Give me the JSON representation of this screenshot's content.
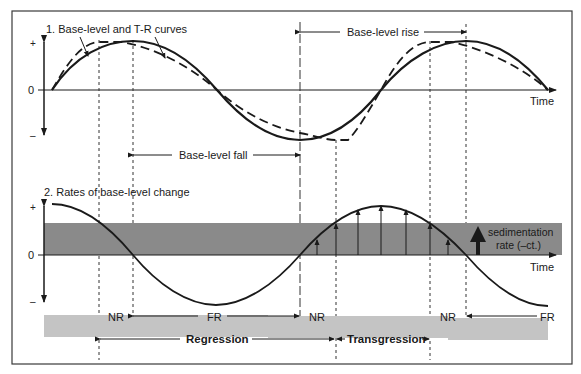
{
  "figure": {
    "panel1": {
      "title": "1. Base-level and T-R curves",
      "axis_plus": "+",
      "axis_zero": "0",
      "axis_minus": "–",
      "x_label": "Time",
      "annotations": {
        "base_level_rise": "Base-level rise",
        "base_level_fall": "Base-level fall"
      },
      "legend": {
        "solid": "Base-level curve",
        "dashed": "T-R curve"
      }
    },
    "panel2": {
      "title": "2. Rates of base-level change",
      "axis_plus": "+",
      "axis_zero": "0",
      "axis_minus": "–",
      "x_label": "Time",
      "sedimentation_label_line1": "sedimentation",
      "sedimentation_label_line2": "rate (–ct.)"
    },
    "stages": {
      "nr1": "NR",
      "fr1": "FR",
      "nr2": "NR",
      "nr3": "NR",
      "fr2": "FR",
      "regression": "Regression",
      "transgression": "Transgression"
    },
    "colors": {
      "curve": "#1a1a1a",
      "band_dark": "#8a8a8a",
      "band_light": "#c4c4c4",
      "frame": "#3a3a3a"
    }
  }
}
